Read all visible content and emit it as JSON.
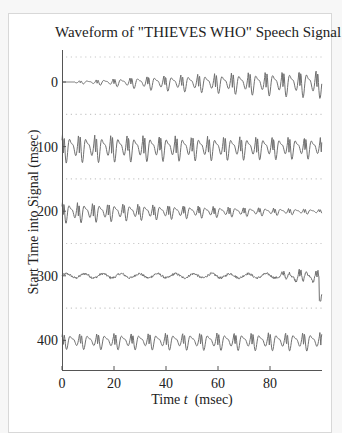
{
  "chart_data": {
    "type": "line",
    "title": "Waveform of \"THIEVES WHO\" Speech Signal",
    "xlabel": "Time t  (msec)",
    "xlabel_parts": {
      "pre": "Time ",
      "var": "t",
      "post": "  (msec)"
    },
    "ylabel": "Start Time into Signal (msec)",
    "xlim": [
      0,
      100
    ],
    "x_ticks": [
      0,
      20,
      40,
      60,
      80
    ],
    "y_ticks": [
      0,
      100,
      200,
      300,
      400
    ],
    "grid": "dotted separators between rows",
    "legend": null,
    "series": [
      {
        "name": "0-100 msec",
        "start_msec": 0,
        "description": "silence ~5 msec, then voiced onset growing to strong periodic signal",
        "onset_msec": 5,
        "amp_start": 0.25,
        "amp_end": 1.0,
        "period_msec": 6.5,
        "noise": 0
      },
      {
        "name": "100-200 msec",
        "start_msec": 100,
        "description": "strong periodic voiced signal, slowly decaying",
        "onset_msec": 0,
        "amp_start": 1.0,
        "amp_end": 0.75,
        "period_msec": 6.2,
        "noise": 0
      },
      {
        "name": "200-300 msec",
        "start_msec": 200,
        "description": "voiced signal decaying to low amplitude",
        "onset_msec": 0,
        "amp_start": 0.75,
        "amp_end": 0.15,
        "period_msec": 5.8,
        "noise": 0
      },
      {
        "name": "300-400 msec",
        "start_msec": 300,
        "description": "low-level fricative noise, voicing resumes near end",
        "onset_msec": 0,
        "amp_start": 0.05,
        "amp_end": 0.05,
        "period_msec": 6.5,
        "noise": 1,
        "voicing_start_msec": 82
      },
      {
        "name": "400-500 msec",
        "start_msec": 400,
        "description": "moderate periodic voiced signal with sharp negative pulses",
        "onset_msec": 0,
        "amp_start": 0.55,
        "amp_end": 0.65,
        "period_msec": 6.6,
        "noise": 0
      }
    ],
    "colors": {
      "waveform": "#707070",
      "axis": "#555555",
      "grid": "#c8c8c8"
    }
  }
}
